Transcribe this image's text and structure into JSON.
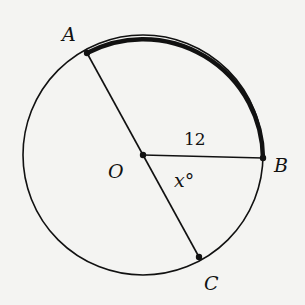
{
  "diagram": {
    "type": "circle-geometry",
    "center": {
      "label": "O"
    },
    "points": [
      {
        "label": "A"
      },
      {
        "label": "B"
      },
      {
        "label": "C"
      }
    ],
    "segments": [
      {
        "from": "A",
        "to": "C",
        "kind": "diameter"
      },
      {
        "from": "O",
        "to": "B",
        "kind": "radius",
        "length_label": "12"
      }
    ],
    "angle_label": "x°",
    "highlighted_arc": "AB",
    "colors": {
      "ink": "#111111",
      "background": "#f4f4f2"
    }
  }
}
